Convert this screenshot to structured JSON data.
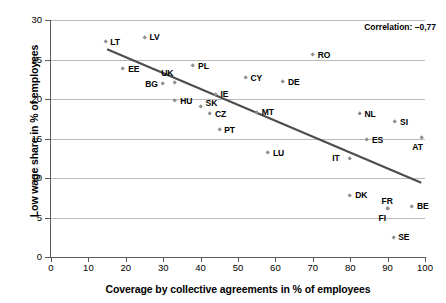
{
  "chart_data": {
    "type": "scatter",
    "title": "",
    "xlabel": "Coverage by collective agreements in % of employees",
    "ylabel": "Low wage share in % of employees",
    "xlim": [
      0,
      100
    ],
    "ylim": [
      0,
      30
    ],
    "xticks": [
      0,
      10,
      20,
      30,
      40,
      50,
      60,
      70,
      80,
      90,
      100
    ],
    "yticks": [
      0,
      5,
      10,
      15,
      20,
      25,
      30
    ],
    "grid": "horizontal",
    "legend": "none",
    "annotations": [
      {
        "name": "correlation",
        "text": "Correlation: –0,77"
      }
    ],
    "trendline": {
      "type": "linear",
      "x_start": 15,
      "y_start": 26.3,
      "x_end": 99,
      "y_end": 9.4,
      "color": "#4d4d4d"
    },
    "marker_color": "#8d8d8d",
    "points": [
      {
        "label": "LT",
        "x": 14.5,
        "y": 27.2,
        "label_pos": "right"
      },
      {
        "label": "LV",
        "x": 25.0,
        "y": 27.8,
        "label_pos": "right"
      },
      {
        "label": "EE",
        "x": 19.3,
        "y": 23.8,
        "label_pos": "right"
      },
      {
        "label": "PL",
        "x": 38.0,
        "y": 24.2,
        "label_pos": "right"
      },
      {
        "label": "RO",
        "x": 70.0,
        "y": 25.6,
        "label_pos": "right"
      },
      {
        "label": "CY",
        "x": 52.0,
        "y": 22.7,
        "label_pos": "right"
      },
      {
        "label": "DE",
        "x": 62.0,
        "y": 22.2,
        "label_pos": "right"
      },
      {
        "label": "BG",
        "x": 30.0,
        "y": 21.9,
        "label_pos": "left"
      },
      {
        "label": "UK",
        "x": 33.2,
        "y": 22.1,
        "label_pos": "below-left"
      },
      {
        "label": "HU",
        "x": 33.2,
        "y": 19.8,
        "label_pos": "right"
      },
      {
        "label": "IE",
        "x": 44.0,
        "y": 20.6,
        "label_pos": "right"
      },
      {
        "label": "SK",
        "x": 40.0,
        "y": 19.0,
        "label_pos": "above-right"
      },
      {
        "label": "CZ",
        "x": 42.5,
        "y": 18.1,
        "label_pos": "right"
      },
      {
        "label": "MT",
        "x": 55.0,
        "y": 18.3,
        "label_pos": "right"
      },
      {
        "label": "PT",
        "x": 45.0,
        "y": 16.1,
        "label_pos": "right"
      },
      {
        "label": "NL",
        "x": 82.5,
        "y": 18.1,
        "label_pos": "right"
      },
      {
        "label": "SI",
        "x": 92.0,
        "y": 17.1,
        "label_pos": "right"
      },
      {
        "label": "ES",
        "x": 84.5,
        "y": 14.8,
        "label_pos": "right"
      },
      {
        "label": "AT",
        "x": 99.0,
        "y": 15.1,
        "label_pos": "below"
      },
      {
        "label": "LU",
        "x": 58.0,
        "y": 13.2,
        "label_pos": "right"
      },
      {
        "label": "IT",
        "x": 80.0,
        "y": 12.5,
        "label_pos": "left"
      },
      {
        "label": "DK",
        "x": 80.0,
        "y": 7.8,
        "label_pos": "right"
      },
      {
        "label": "FR",
        "x": 90.0,
        "y": 6.1,
        "label_pos": "above"
      },
      {
        "label": "FI",
        "x": 90.0,
        "y": 6.1,
        "label_pos": "below"
      },
      {
        "label": "BE",
        "x": 96.5,
        "y": 6.4,
        "label_pos": "right"
      },
      {
        "label": "SE",
        "x": 91.5,
        "y": 2.5,
        "label_pos": "right"
      }
    ]
  }
}
